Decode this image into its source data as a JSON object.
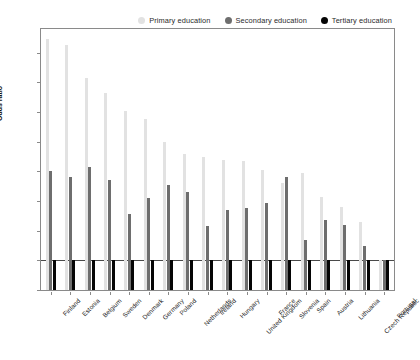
{
  "chart_data": {
    "type": "bar",
    "title": "",
    "subtitle": "",
    "xlabel": "",
    "ylabel": "Odds ratio",
    "ylim": [
      0.0,
      8.8
    ],
    "yticks": [
      "0.0",
      "1.0",
      "2.0",
      "3.0",
      "4.0",
      "5.0",
      "6.0",
      "7.0",
      "8.0"
    ],
    "ytick_values": [
      0.0,
      1.0,
      2.0,
      3.0,
      4.0,
      5.0,
      6.0,
      7.0,
      8.0
    ],
    "grid": false,
    "legend_position": "top-right",
    "reference_line": 1.0,
    "categories": [
      "Finland",
      "Estonia",
      "Belgium",
      "Sweden",
      "Denmark",
      "Germany",
      "Poland",
      "Netherlands",
      "Ireland",
      "Hungary",
      "United Kingdom",
      "France",
      "Slovenia",
      "Spain",
      "Austria",
      "Lithuania",
      "Czech Republic",
      "Portugal"
    ],
    "series": [
      {
        "name": "Primary education",
        "color": "#e2e2e2",
        "values": [
          8.45,
          8.25,
          7.15,
          6.65,
          6.05,
          5.75,
          5.0,
          4.6,
          4.5,
          4.4,
          4.35,
          4.05,
          3.6,
          3.95,
          3.15,
          2.8,
          2.3,
          1.0
        ]
      },
      {
        "name": "Secondary education",
        "color": "#6e6e6e",
        "values": [
          4.0,
          3.8,
          4.15,
          3.7,
          2.55,
          3.1,
          3.55,
          3.3,
          2.15,
          2.7,
          2.75,
          2.95,
          3.8,
          1.7,
          2.35,
          2.2,
          1.5,
          1.0
        ]
      },
      {
        "name": "Tertiary education",
        "color": "#050505",
        "values": [
          1.0,
          1.0,
          1.0,
          1.0,
          1.0,
          1.0,
          1.0,
          1.0,
          1.0,
          1.0,
          1.0,
          1.0,
          1.0,
          1.0,
          1.0,
          1.0,
          1.0,
          1.0
        ]
      }
    ]
  },
  "legend": {
    "items": [
      {
        "label": "Primary education",
        "color": "#e2e2e2"
      },
      {
        "label": "Secondary education",
        "color": "#6e6e6e"
      },
      {
        "label": "Tertiary education",
        "color": "#050505"
      }
    ]
  },
  "axes": {
    "y_title": "Odds ratio"
  }
}
